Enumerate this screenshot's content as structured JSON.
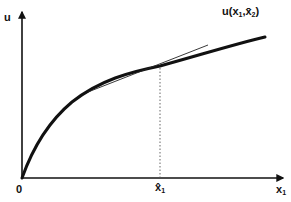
{
  "diagram": {
    "type": "utility-function-graph",
    "y_axis_label": "u",
    "x_axis_label": "x",
    "x_axis_subscript": "1",
    "origin_label": "0",
    "curve_label": {
      "main": "u(x",
      "sub1": "1",
      "sep": ",x̄",
      "sub2": "2",
      "close": ")"
    },
    "tick_label": {
      "main": "x̂",
      "sub": "1"
    },
    "elements": [
      "concave utility curve",
      "tangent line at x̂1",
      "dotted vertical line from tangency point to x-axis"
    ],
    "colors": {
      "ink": "#111111",
      "background": "#ffffff"
    }
  }
}
